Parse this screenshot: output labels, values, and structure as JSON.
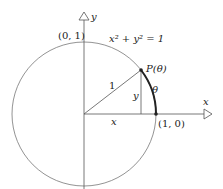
{
  "diagram": {
    "equation": "x² + y² = 1",
    "labels": {
      "y_axis": "y",
      "x_axis": "x",
      "top_point": "(0, 1)",
      "right_point": "(1, 0)",
      "point_p": "P(θ)",
      "radius": "1",
      "leg_x": "x",
      "leg_y": "y",
      "arc_theta": "θ"
    },
    "colors": {
      "stroke": "#555555",
      "arc": "#222222"
    }
  }
}
